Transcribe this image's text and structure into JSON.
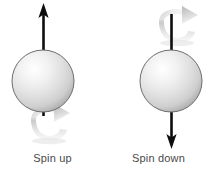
{
  "diagram": {
    "background_color": "#ffffff",
    "width": 211,
    "height": 179,
    "figures": [
      {
        "id": "spin-up",
        "caption": "Spin up",
        "sphere": {
          "center_x": 43,
          "center_y": 81,
          "radius": 31,
          "fill_highlight": "#ffffff",
          "fill_mid": "#e2e2e2",
          "fill_edge": "#b6b6b6",
          "stroke": "#6e6e6e"
        },
        "axis_arrow": {
          "direction": "up",
          "color": "#0d0d0d",
          "x": 43,
          "from_y": 115,
          "to_y": 5
        },
        "rotation_arrow": {
          "position": "below-sphere",
          "direction": "clockwise-right",
          "center_x": 43,
          "center_y": 128,
          "color": "#d7d7d7",
          "shadow": "#9a9a9a"
        }
      },
      {
        "id": "spin-down",
        "caption": "Spin down",
        "sphere": {
          "center_x": 65,
          "center_y": 81,
          "radius": 31,
          "fill_highlight": "#ffffff",
          "fill_mid": "#e2e2e2",
          "fill_edge": "#b6b6b6",
          "stroke": "#6e6e6e"
        },
        "axis_arrow": {
          "direction": "down",
          "color": "#0d0d0d",
          "x": 65,
          "from_y": 47,
          "to_y": 148
        },
        "rotation_arrow": {
          "position": "above-sphere",
          "direction": "clockwise-right",
          "center_x": 65,
          "center_y": 28,
          "color": "#d7d7d7",
          "shadow": "#9a9a9a"
        }
      }
    ]
  }
}
